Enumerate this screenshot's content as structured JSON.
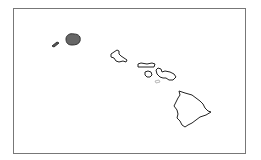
{
  "map": {
    "region": "Hawaiian Islands",
    "colors": {
      "frame": "#777777",
      "outline": "#222222",
      "highlight_fill": "#666666",
      "background": "#ffffff"
    },
    "islands": [
      {
        "name": "Niihau",
        "highlighted": true
      },
      {
        "name": "Kauai",
        "highlighted": true
      },
      {
        "name": "Oahu",
        "highlighted": false
      },
      {
        "name": "Molokai",
        "highlighted": false
      },
      {
        "name": "Lanai",
        "highlighted": false
      },
      {
        "name": "Maui",
        "highlighted": false
      },
      {
        "name": "Kahoolawe",
        "highlighted": false
      },
      {
        "name": "Hawaii",
        "highlighted": false
      }
    ]
  }
}
